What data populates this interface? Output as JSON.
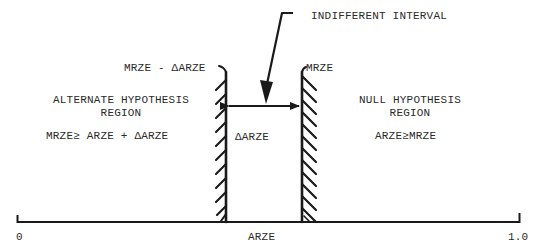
{
  "diagram": {
    "title_pointer_label": "INDIFFERENT INTERVAL",
    "left_boundary_label": "MRZE - ΔARZE",
    "right_boundary_label": "MRZE",
    "interval_width_label": "ΔARZE",
    "alternate_region": {
      "title_line1": "ALTERNATE HYPOTHESIS",
      "title_line2": "REGION",
      "condition": "MRZE≥ ARZE + ΔARZE"
    },
    "null_region": {
      "title_line1": "NULL HYPOTHESIS",
      "title_line2": "REGION",
      "condition": "ARZE≥MRZE"
    },
    "axis": {
      "label": "ARZE",
      "min_label": "0",
      "max_label": "1.0"
    },
    "colors": {
      "ink": "#1a1a1a",
      "background": "#ffffff"
    }
  }
}
